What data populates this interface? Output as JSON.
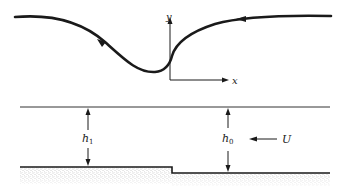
{
  "diagram": {
    "type": "flow-over-step-schematic",
    "streamline": {
      "description": "curved streamline with flow direction arrows pointing leftward",
      "arrow_count": 2
    },
    "axes": {
      "x_label": "x",
      "y_label": "y"
    },
    "channel": {
      "depth_left_label": "h",
      "depth_left_subscript": "1",
      "depth_right_label": "h",
      "depth_right_subscript": "0",
      "velocity_label": "U",
      "velocity_direction": "left"
    },
    "colors": {
      "line": "#1a1a1a",
      "bed_stipple": "#8a8a8a",
      "background": "#ffffff"
    }
  }
}
